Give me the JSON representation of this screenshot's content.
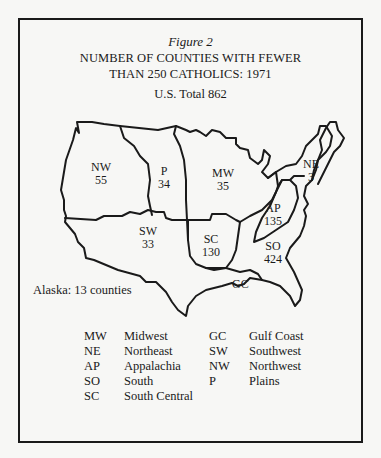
{
  "figure": {
    "label": "Figure 2",
    "title_line1": "NUMBER OF COUNTIES WITH FEWER",
    "title_line2": "THAN 250 CATHOLICS: 1971",
    "total": "U.S. Total 862"
  },
  "regions": [
    {
      "abbr": "NW",
      "value": "55"
    },
    {
      "abbr": "P",
      "value": "34"
    },
    {
      "abbr": "MW",
      "value": "35"
    },
    {
      "abbr": "NE",
      "value": "3"
    },
    {
      "abbr": "AP",
      "value": "135"
    },
    {
      "abbr": "SW",
      "value": "33"
    },
    {
      "abbr": "SC",
      "value": "130"
    },
    {
      "abbr": "SO",
      "value": "424"
    },
    {
      "abbr": "GC",
      "value": ""
    }
  ],
  "alaska_note": "Alaska: 13 counties",
  "legend": {
    "left": [
      {
        "abbr": "MW",
        "name": "Midwest"
      },
      {
        "abbr": "NE",
        "name": "Northeast"
      },
      {
        "abbr": "AP",
        "name": "Appalachia"
      },
      {
        "abbr": "SO",
        "name": "South"
      },
      {
        "abbr": "SC",
        "name": "South Central"
      }
    ],
    "right": [
      {
        "abbr": "GC",
        "name": "Gulf Coast"
      },
      {
        "abbr": "SW",
        "name": "Southwest"
      },
      {
        "abbr": "NW",
        "name": "Northwest"
      },
      {
        "abbr": "P",
        "name": "Plains"
      }
    ]
  },
  "colors": {
    "ink": "#1a1a1a",
    "paper": "#f7f7f5"
  }
}
